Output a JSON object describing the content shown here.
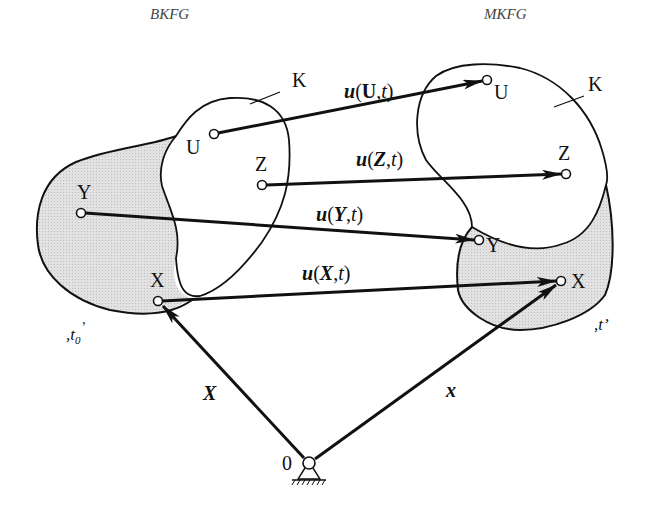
{
  "diagram": {
    "title_left": "BKFG",
    "title_right": "MKFG",
    "body_label_left": "K",
    "body_label_right": "K",
    "time_left": {
      "prefix": ",t",
      "sub": "0",
      "suffix": "’"
    },
    "time_right": ",t’",
    "origin_label": "0",
    "position_vector_reference": "X",
    "position_vector_current": "x",
    "points_reference": [
      {
        "id": "U",
        "label": "U"
      },
      {
        "id": "Z",
        "label": "Z"
      },
      {
        "id": "Y",
        "label": "Y"
      },
      {
        "id": "X",
        "label": "X"
      }
    ],
    "points_current": [
      {
        "id": "U",
        "label": "U"
      },
      {
        "id": "Z",
        "label": "Z"
      },
      {
        "id": "Y",
        "label": "Y"
      },
      {
        "id": "X",
        "label": "X"
      }
    ],
    "displacements": [
      {
        "fn": "u",
        "arg": "U",
        "t": "t"
      },
      {
        "fn": "u",
        "arg": "Z",
        "t": "t"
      },
      {
        "fn": "u",
        "arg": "Y",
        "t": "t"
      },
      {
        "fn": "u",
        "arg": "X",
        "t": "t"
      }
    ],
    "colors": {
      "stroke": "#111111",
      "shade": "#dcdcdc",
      "background": "#ffffff"
    }
  }
}
